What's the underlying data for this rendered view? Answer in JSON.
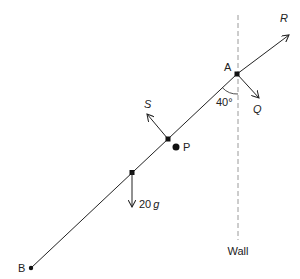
{
  "diagram": {
    "type": "statics-rod-against-wall",
    "colors": {
      "ink": "#222222",
      "wall": "#9a9a9a",
      "background": "#ffffff"
    },
    "points": {
      "A": {
        "label": "A"
      },
      "B": {
        "label": "B"
      },
      "P": {
        "label": "P"
      }
    },
    "forces": {
      "R": {
        "label": "R"
      },
      "Q": {
        "label": "Q"
      },
      "S": {
        "label": "S"
      },
      "weight": {
        "label": "20",
        "unit": "g"
      }
    },
    "angle": {
      "label": "40°"
    },
    "wall": {
      "label": "Wall"
    }
  }
}
